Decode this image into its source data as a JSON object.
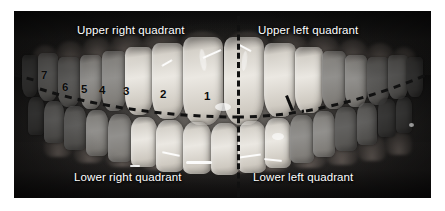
{
  "figure": {
    "kind": "intraoral-photograph",
    "border_color": "#ffffff",
    "annotation_line_color": "#111111",
    "label_text_color": "#ffffff",
    "number_text_color": "#0b0b0b"
  },
  "quadrant_labels": [
    {
      "id": "upper-right",
      "text": "Upper right quadrant",
      "x": 77,
      "y": 25
    },
    {
      "id": "upper-left",
      "text": "Upper left quadrant",
      "x": 258,
      "y": 25
    },
    {
      "id": "lower-right",
      "text": "Lower right quadrant",
      "x": 74,
      "y": 172
    },
    {
      "id": "lower-left",
      "text": "Lower left quadrant",
      "x": 253,
      "y": 172
    }
  ],
  "tooth_numbers": [
    {
      "label": "7",
      "x": 41,
      "y": 70
    },
    {
      "label": "6",
      "x": 62,
      "y": 82
    },
    {
      "label": "5",
      "x": 81,
      "y": 84
    },
    {
      "label": "4",
      "x": 99,
      "y": 85
    },
    {
      "label": "3",
      "x": 123,
      "y": 86
    },
    {
      "label": "2",
      "x": 160,
      "y": 89
    },
    {
      "label": "1",
      "x": 204,
      "y": 91
    }
  ],
  "annotations": {
    "midline": {
      "name": "vertical-midline",
      "style": "dashed",
      "x": 237,
      "y_top": 16,
      "y_bottom": 197
    },
    "occlusal_line": {
      "name": "horizontal-occlusal-line",
      "style": "dashed",
      "path_note": "curved line running left edge to right edge, dipping to its lowest point near the midline"
    }
  }
}
